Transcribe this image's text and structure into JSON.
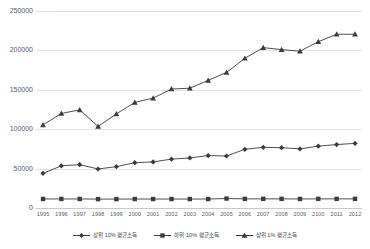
{
  "chart_data": {
    "type": "line",
    "title": "",
    "xlabel": "",
    "ylabel": "",
    "ylim": [
      0,
      250000
    ],
    "yticks": [
      0,
      50000,
      100000,
      150000,
      200000,
      250000
    ],
    "ytick_labels": [
      "0",
      "50000",
      "100000",
      "150000",
      "200000",
      "250000"
    ],
    "grid": "horizontal",
    "legend_position": "bottom-center",
    "categories": [
      "1995",
      "1996",
      "1997",
      "1998",
      "1999",
      "2000",
      "2001",
      "2002",
      "2003",
      "2004",
      "2005",
      "2006",
      "2007",
      "2008",
      "2009",
      "2100",
      "2011",
      "2012"
    ],
    "series": [
      {
        "name": "상위 10% 평균소득",
        "marker": "diamond",
        "color": "#3b3b3b",
        "values": [
          44000,
          53500,
          55000,
          49500,
          52500,
          57500,
          58500,
          62000,
          63500,
          66500,
          66000,
          74500,
          77000,
          76500,
          75000,
          78500,
          80500,
          82000
        ]
      },
      {
        "name": "하위 10% 평균소득",
        "marker": "square",
        "color": "#3b3b3b",
        "values": [
          11500,
          11500,
          11500,
          11300,
          11300,
          11400,
          11400,
          11400,
          11400,
          11400,
          12000,
          11600,
          11600,
          11600,
          11500,
          11600,
          11600,
          11600
        ]
      },
      {
        "name": "상위 1% 평균소득",
        "marker": "triangle",
        "color": "#3b3b3b",
        "values": [
          105500,
          120000,
          124500,
          103500,
          119500,
          134000,
          139500,
          151000,
          152000,
          162000,
          172000,
          190000,
          203500,
          201000,
          199000,
          211000,
          220500,
          220500
        ]
      }
    ]
  },
  "legend": {
    "items": [
      {
        "label": "상위 10% 평균소득",
        "marker": "diamond"
      },
      {
        "label": "하위 10% 평균소득",
        "marker": "square"
      },
      {
        "label": "상위 1% 평균소득",
        "marker": "triangle"
      }
    ]
  }
}
